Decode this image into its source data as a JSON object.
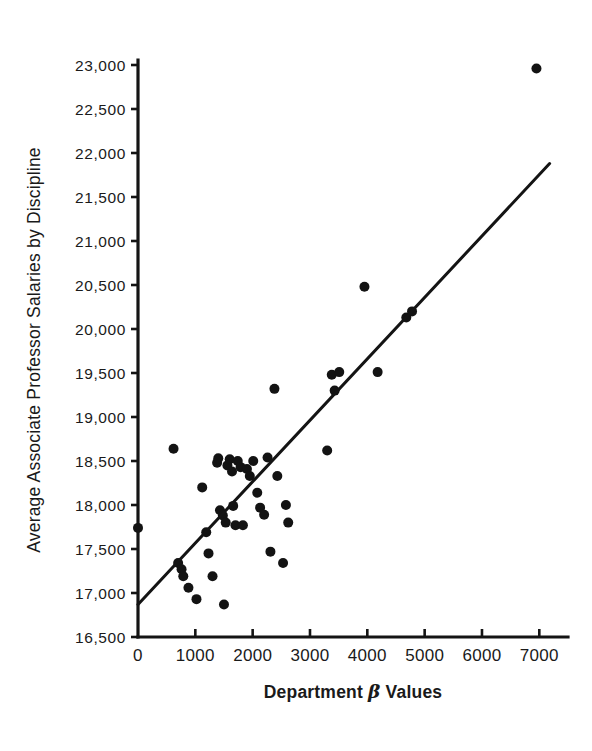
{
  "chart_data": {
    "type": "scatter",
    "title": "",
    "xlabel": "Department β Values",
    "ylabel": "Average Associate Professor Salaries by Discipline",
    "xlim": [
      0,
      7500
    ],
    "ylim": [
      16500,
      23000
    ],
    "xticks": [
      0,
      1000,
      2000,
      3000,
      4000,
      5000,
      6000,
      7000
    ],
    "xtick_labels": [
      "0",
      "1000",
      "2000",
      "3000",
      "4000",
      "5000",
      "6000",
      "7000"
    ],
    "yticks": [
      16500,
      17000,
      17500,
      18000,
      18500,
      19000,
      19500,
      20000,
      20500,
      21000,
      21500,
      22000,
      22500,
      23000
    ],
    "ytick_labels": [
      "16,500",
      "17,000",
      "17,500",
      "18,000",
      "18,500",
      "19,000",
      "19,500",
      "20,000",
      "20,500",
      "21,000",
      "21,500",
      "22,000",
      "22,500",
      "23,000"
    ],
    "grid": false,
    "legend": null,
    "marker": "filled-circle",
    "marker_color": "#131313",
    "marker_size_px": 10,
    "n_points": 45,
    "points": [
      [
        0,
        17740
      ],
      [
        620,
        18640
      ],
      [
        700,
        17340
      ],
      [
        760,
        17270
      ],
      [
        790,
        17190
      ],
      [
        880,
        17060
      ],
      [
        1020,
        16930
      ],
      [
        1120,
        18200
      ],
      [
        1190,
        17690
      ],
      [
        1230,
        17450
      ],
      [
        1300,
        17190
      ],
      [
        1380,
        18480
      ],
      [
        1400,
        18530
      ],
      [
        1430,
        17940
      ],
      [
        1480,
        17880
      ],
      [
        1500,
        16870
      ],
      [
        1530,
        17800
      ],
      [
        1560,
        18450
      ],
      [
        1600,
        18520
      ],
      [
        1640,
        18380
      ],
      [
        1660,
        17990
      ],
      [
        1700,
        17770
      ],
      [
        1740,
        18500
      ],
      [
        1790,
        18430
      ],
      [
        1830,
        17770
      ],
      [
        1900,
        18410
      ],
      [
        1950,
        18330
      ],
      [
        2010,
        18500
      ],
      [
        2080,
        18140
      ],
      [
        2130,
        17970
      ],
      [
        2200,
        17890
      ],
      [
        2260,
        18540
      ],
      [
        2310,
        17470
      ],
      [
        2380,
        19320
      ],
      [
        2430,
        18330
      ],
      [
        2530,
        17340
      ],
      [
        2580,
        18000
      ],
      [
        2620,
        17800
      ],
      [
        3300,
        18620
      ],
      [
        3380,
        19480
      ],
      [
        3430,
        19300
      ],
      [
        3510,
        19510
      ],
      [
        3950,
        20480
      ],
      [
        4180,
        19510
      ],
      [
        4680,
        20130
      ],
      [
        4780,
        20200
      ],
      [
        6950,
        22960
      ]
    ],
    "fit_line": {
      "label": "least-squares regression line",
      "x_start": 0,
      "y_start": 16870,
      "x_end": 7180,
      "y_end": 21880
    }
  }
}
